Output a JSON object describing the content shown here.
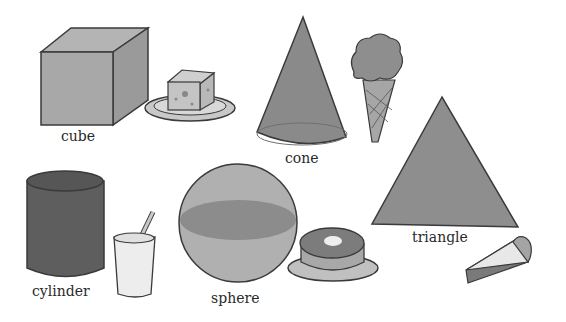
{
  "labels": {
    "cube": "cube",
    "cone": "cone",
    "cylinder": "cylinder",
    "sphere": "sphere",
    "triangle": "triangle"
  },
  "colors": {
    "background": "#ffffff",
    "outline": "#3a3a3a",
    "cube_front": "#a8a8a8",
    "cube_top": "#b4b4b4",
    "cube_side": "#9a9a9a",
    "cone_fill": "#8a8a8a",
    "cylinder_fill": "#5e5e5e",
    "sphere_fill": "#b0b0b0",
    "sphere_band": "#8c8c8c",
    "triangle_fill": "#8e8e8e",
    "object_light": "#d6d6d6",
    "object_mid": "#a0a0a0"
  },
  "objects": [
    {
      "shape": "cube",
      "example": "cheese on plate"
    },
    {
      "shape": "cone",
      "example": "ice cream cone"
    },
    {
      "shape": "cylinder",
      "example": "glass with straw"
    },
    {
      "shape": "sphere",
      "example": "donut on plate"
    },
    {
      "shape": "triangle",
      "example": "slice of pie"
    }
  ]
}
